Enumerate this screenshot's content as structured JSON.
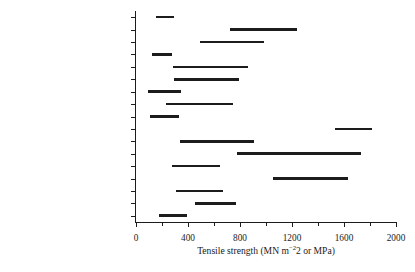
{
  "chart_data": {
    "type": "bar",
    "orientation": "horizontal",
    "style": "range-bar",
    "title": "",
    "xlabel": "Tensile strength (MN m−2 or MPa)",
    "ylabel": "",
    "xlim": [
      0,
      2000
    ],
    "grid": false,
    "legend": null,
    "xticks_major": [
      0,
      400,
      800,
      1200,
      1600,
      2000
    ],
    "xticks_minor": [
      200,
      600,
      1000,
      1400,
      1800
    ],
    "xticklabels": [
      "0",
      "400",
      "800",
      "1200",
      "1600",
      "2000"
    ],
    "categories": [
      "Zinc alloys",
      "Titanium alloys",
      "Nickel alloys",
      "Magnesium alloys",
      "Tin bronzes",
      "Brasses",
      "Aluminium alloys",
      "SG cast iron",
      "Grey cast iron",
      "Maraging steel",
      "Austenitic stainless steel",
      "Martensitic stainless steel",
      "Ferritic stainless steel",
      "Nickel chrome steel",
      "Low-alloy steel",
      "High-carbon steel",
      "Mild steel"
    ],
    "ranges": [
      [
        155,
        295
      ],
      [
        725,
        1240
      ],
      [
        490,
        985
      ],
      [
        125,
        280
      ],
      [
        285,
        865
      ],
      [
        295,
        790
      ],
      [
        90,
        345
      ],
      [
        230,
        750
      ],
      [
        110,
        330
      ],
      [
        1530,
        1815
      ],
      [
        340,
        910
      ],
      [
        775,
        1730
      ],
      [
        280,
        650
      ],
      [
        1055,
        1630
      ],
      [
        305,
        670
      ],
      [
        455,
        770
      ],
      [
        175,
        395
      ]
    ],
    "units": "MPa"
  }
}
